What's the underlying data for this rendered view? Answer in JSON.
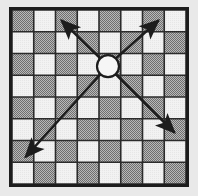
{
  "figure": {
    "title": "Bishop diagonal movement on a chessboard",
    "caption": "",
    "background_color": "#e9e9e9"
  },
  "board": {
    "name": "chessboard",
    "columns": 8,
    "rows": 8,
    "origin_x": 12,
    "origin_y": 10,
    "cell_size": 21.75,
    "dark_square_color": "#9a9a9a",
    "light_square_color": "#f2f2f2",
    "grid_line_color": "#2b2b2b",
    "grid_line_width": 1.6,
    "border_color": "#1d1d1d",
    "border_width": 3,
    "first_square_dark": true,
    "square_fill_pattern": "dither-checker"
  },
  "piece": {
    "name": "bishop-marker",
    "shape": "circle",
    "center_x": 108,
    "center_y": 66.2,
    "radius": 11,
    "fill_color": "#f6f6f6",
    "stroke_color": "#1d1d1d",
    "stroke_width": 2.2
  },
  "arrows": {
    "color": "#1d1d1d",
    "shaft_width": 2.6,
    "head_length": 15,
    "head_width": 6.5,
    "items": [
      {
        "name": "arrow-up-left",
        "label": "up-left diagonal",
        "direction": "up-left",
        "from_x": 100.6,
        "from_y": 58.6,
        "to_x": 61.5,
        "to_y": 20.5
      },
      {
        "name": "arrow-up-right",
        "label": "up-right diagonal",
        "direction": "up-right",
        "from_x": 115.6,
        "from_y": 58.6,
        "to_x": 158.5,
        "to_y": 20.5
      },
      {
        "name": "arrow-down-left",
        "label": "down-left diagonal",
        "direction": "down-left",
        "from_x": 100.6,
        "from_y": 74.0,
        "to_x": 25.5,
        "to_y": 157.0
      },
      {
        "name": "arrow-down-right",
        "label": "down-right diagonal",
        "direction": "down-right",
        "from_x": 115.6,
        "from_y": 74.0,
        "to_x": 174.5,
        "to_y": 132.5
      }
    ]
  }
}
